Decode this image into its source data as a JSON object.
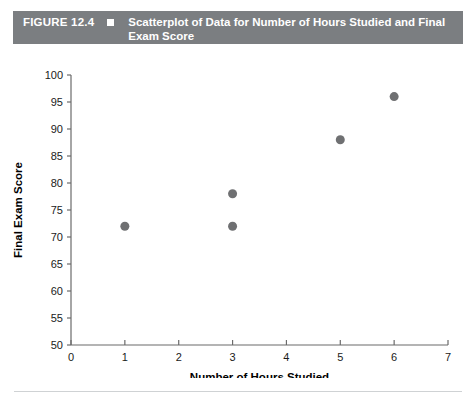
{
  "figure": {
    "number_label": "FIGURE 12.4",
    "bullet_icon": "square-bullet-icon",
    "title": "Scatterplot of Data for Number of Hours Studied and Final Exam Score",
    "band_color": "#7b7e81",
    "band_text_color": "#ffffff"
  },
  "chart_data": {
    "type": "scatter",
    "title": "",
    "xlabel": "Number of Hours Studied",
    "ylabel": "Final Exam Score",
    "xlim": [
      0,
      7
    ],
    "ylim": [
      50,
      100
    ],
    "xticks": [
      0,
      1,
      2,
      3,
      4,
      5,
      6,
      7
    ],
    "yticks": [
      50,
      55,
      60,
      65,
      70,
      75,
      80,
      85,
      90,
      95,
      100
    ],
    "xtick_labels": [
      "0",
      "1",
      "2",
      "3",
      "4",
      "5",
      "6",
      "7"
    ],
    "ytick_labels": [
      "50",
      "55",
      "60",
      "65",
      "70",
      "75",
      "80",
      "85",
      "90",
      "95",
      "100"
    ],
    "grid": false,
    "legend": false,
    "marker": "circle",
    "marker_color": "#6f7072",
    "marker_size": 9,
    "points": [
      {
        "x": 1,
        "y": 72
      },
      {
        "x": 3,
        "y": 72
      },
      {
        "x": 3,
        "y": 78
      },
      {
        "x": 5,
        "y": 88
      },
      {
        "x": 6,
        "y": 96
      }
    ],
    "axis_color": "#6b6b6b"
  },
  "divider": {
    "color": "#cfd2d4"
  }
}
